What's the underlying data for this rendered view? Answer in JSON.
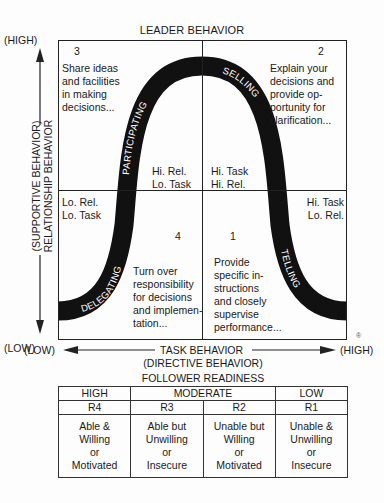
{
  "diagram": {
    "top_label": "LEADER BEHAVIOR",
    "y_axis": {
      "high": "(HIGH)",
      "low": "(LOW)",
      "label_line1": "(SUPPORTIVE BEHAVIOR)",
      "label_line2": "RELATIONSHIP BEHAVIOR"
    },
    "x_axis": {
      "low": "(LOW)",
      "high": "(HIGH)",
      "label_line1": "TASK BEHAVIOR",
      "label_line2": "(DIRECTIVE BEHAVIOR)"
    },
    "registered_mark": "®",
    "quadrants": [
      {
        "number": "3",
        "style": "PARTICIPATING",
        "description": [
          "Share ideas",
          "and facilities",
          "in making",
          "decisions..."
        ],
        "combo": [
          "Hi. Rel.",
          "Lo. Task"
        ]
      },
      {
        "number": "2",
        "style": "SELLING",
        "description": [
          "Explain your",
          "decisions and",
          "provide op-",
          "portunity for",
          "clarification..."
        ],
        "combo": [
          "Hi. Task",
          "Hi. Rel."
        ]
      },
      {
        "number": "1",
        "style": "TELLING",
        "description": [
          "Provide",
          "specific in-",
          "structions",
          "and closely",
          "supervise",
          "performance..."
        ],
        "combo": [
          "Hi. Task",
          "Lo. Rel."
        ]
      },
      {
        "number": "4",
        "style": "DELEGATING",
        "description": [
          "Turn over",
          "responsibility",
          "for decisions",
          "and implemen-",
          "tation..."
        ],
        "combo": [
          "Lo. Rel.",
          "Lo. Task"
        ]
      }
    ],
    "colors": {
      "curve": "#111111",
      "line": "#222222",
      "text": "#1a1a1a"
    }
  },
  "readiness": {
    "title": "FOLLOWER READINESS",
    "levels": [
      "HIGH",
      "MODERATE",
      "LOW"
    ],
    "codes": [
      "R4",
      "R3",
      "R2",
      "R1"
    ],
    "descriptions": [
      [
        "Able &",
        "Willing",
        "or",
        "Motivated"
      ],
      [
        "Able but",
        "Unwilling",
        "or",
        "Insecure"
      ],
      [
        "Unable but",
        "Willing",
        "or",
        "Motivated"
      ],
      [
        "Unable &",
        "Unwilling",
        "or",
        "Insecure"
      ]
    ]
  }
}
